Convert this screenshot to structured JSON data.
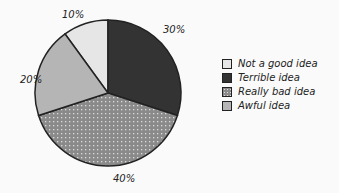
{
  "chart_data": {
    "type": "pie",
    "title": "",
    "categories": [
      "Not a good idea",
      "Terrible idea",
      "Really bad idea",
      "Awful idea"
    ],
    "values": [
      10,
      30,
      40,
      20
    ],
    "value_labels": [
      "10%",
      "30%",
      "40%",
      "20%"
    ],
    "colors": [
      "#e6e6e6",
      "#333333",
      "#8a8a8a",
      "#b5b5b5"
    ],
    "patterns": [
      "solid",
      "solid",
      "dotted",
      "solid"
    ],
    "legend_position": "right",
    "style": "hand-drawn"
  },
  "legend": {
    "items": [
      {
        "label": "Not a good idea"
      },
      {
        "label": "Terrible idea"
      },
      {
        "label": "Really bad idea"
      },
      {
        "label": "Awful idea"
      }
    ]
  },
  "labels": {
    "l10": "10%",
    "l30": "30%",
    "l40": "40%",
    "l20": "20%"
  }
}
